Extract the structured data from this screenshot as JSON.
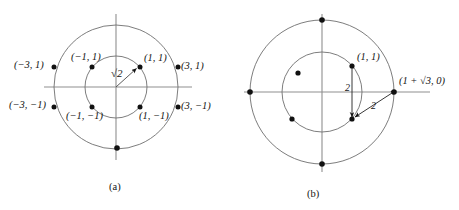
{
  "figure": {
    "width": 459,
    "height": 210,
    "background": "#ffffff",
    "stroke_color": "#6e6e6e",
    "axis_color": "#8a8a8a",
    "dot_color": "#111111",
    "text_color": "#141414"
  },
  "panel_a": {
    "caption": "(a)",
    "center": {
      "x": 116,
      "y": 87
    },
    "outer_radius": 62,
    "inner_radius": 31,
    "radius_label": "√2",
    "points": [
      {
        "label": "(−3, 1)",
        "x": 54,
        "y": 67
      },
      {
        "label": "(−1, 1)",
        "x": 92,
        "y": 67
      },
      {
        "label": "(1, 1)",
        "x": 140,
        "y": 67
      },
      {
        "label": "(3, 1)",
        "x": 178,
        "y": 67
      },
      {
        "label": "(−3, −1)",
        "x": 54,
        "y": 107
      },
      {
        "label": "(−1, −1)",
        "x": 92,
        "y": 107
      },
      {
        "label": "(1, −1)",
        "x": 140,
        "y": 107
      },
      {
        "label": "(3, −1)",
        "x": 178,
        "y": 107
      }
    ],
    "extra_dot": {
      "x": 117,
      "y": 148
    },
    "label_positions": [
      {
        "text": "(−3, 1)",
        "x": 14,
        "y": 60,
        "name": "label-minus3-1"
      },
      {
        "text": "(−1, 1)",
        "x": 71,
        "y": 52,
        "name": "label-minus1-1"
      },
      {
        "text": "(1, 1)",
        "x": 144,
        "y": 53,
        "name": "label-1-1"
      },
      {
        "text": "(3, 1)",
        "x": 181,
        "y": 61,
        "name": "label-3-1"
      },
      {
        "text": "(−3, −1)",
        "x": 9,
        "y": 100,
        "name": "label-minus3-minus1"
      },
      {
        "text": "(−1, −1)",
        "x": 66,
        "y": 111,
        "name": "label-minus1-minus1"
      },
      {
        "text": "(1, −1)",
        "x": 139,
        "y": 111,
        "name": "label-1-minus1"
      },
      {
        "text": "(3, −1)",
        "x": 181,
        "y": 101,
        "name": "label-3-minus1"
      }
    ],
    "radius_label_pos": {
      "x": 111,
      "y": 68
    },
    "caption_pos": {
      "x": 109,
      "y": 182
    }
  },
  "panel_b": {
    "caption": "(b)",
    "center": {
      "x": 322,
      "y": 92
    },
    "outer_radius": 72,
    "inner_radius": 40,
    "point_label": "(1, 1)",
    "axis_point_label": "(1 + √3, 0)",
    "distance_label_vertical": "2",
    "distance_label_diagonal": "2",
    "outer_points": [
      {
        "x": 322,
        "y": 20
      },
      {
        "x": 250,
        "y": 92
      },
      {
        "x": 322,
        "y": 164
      },
      {
        "x": 394,
        "y": 92
      }
    ],
    "inner_points": [
      {
        "x": 352,
        "y": 66
      },
      {
        "x": 298,
        "y": 73
      },
      {
        "x": 292,
        "y": 119
      },
      {
        "x": 352,
        "y": 119
      }
    ],
    "point_label_pos": {
      "x": 357,
      "y": 52
    },
    "axis_label_pos": {
      "x": 399,
      "y": 76
    },
    "vert_label_pos": {
      "x": 345,
      "y": 83
    },
    "diag_label_pos": {
      "x": 371,
      "y": 101
    },
    "caption_pos": {
      "x": 307,
      "y": 189
    }
  }
}
